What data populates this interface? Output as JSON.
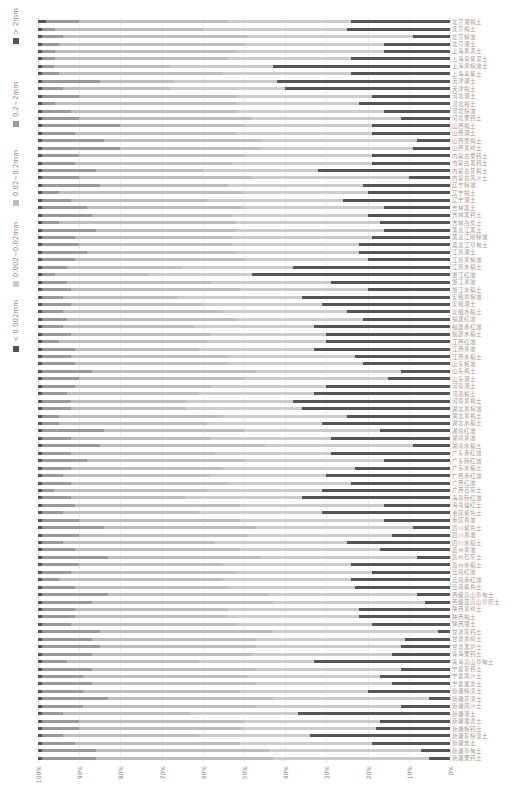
{
  "chart_data": {
    "type": "bar",
    "orientation": "horizontal-stacked-100",
    "title": "",
    "xlabel": "",
    "ylabel": "",
    "xlim": [
      100,
      0
    ],
    "x_ticks": [
      "100%",
      "90%",
      "80%",
      "70%",
      "60%",
      "50%",
      "40%",
      "30%",
      "20%",
      "10%",
      "0%"
    ],
    "grid": true,
    "legend_position": "left",
    "series_names": [
      "< 0.002mm",
      "0.002~0.02mm",
      "0.02~0.2mm",
      "0.2~2mm",
      "> 2mm"
    ],
    "colors": [
      "#555555",
      "#cccccc",
      "#bdbdbd",
      "#999999",
      "#555555"
    ],
    "categories": [
      "北京潮褐土",
      "北京褐土",
      "北京棕壤",
      "北京潮土",
      "上海黄泥土",
      "上海青紫泥土",
      "上海黄棕壤土",
      "上海青紫土",
      "天津潮土",
      "天津褐土",
      "河北潮土",
      "河北褐土",
      "河北棕壤",
      "河北栗钙土",
      "山西褐土",
      "山西潮土",
      "山西栗褐土",
      "山西黄绵土",
      "内蒙古栗钙土",
      "内蒙古黑钙土",
      "内蒙古灰褐土",
      "内蒙古风沙土",
      "辽宁棕壤",
      "辽宁褐土",
      "辽宁潮土",
      "吉林黑土",
      "吉林黑钙土",
      "吉林白浆土",
      "黑龙江黑土",
      "黑龙江暗棕壤",
      "黑龙江草甸土",
      "江苏潮土",
      "江苏黄棕壤",
      "江苏水稻土",
      "浙江红壤",
      "浙江黄壤",
      "浙江水稻土",
      "安徽黄棕壤",
      "安徽潮土",
      "安徽水稻土",
      "福建红壤",
      "福建赤红壤",
      "福建水稻土",
      "江西红壤",
      "江西黄壤",
      "江西水稻土",
      "山东棕壤",
      "山东褐土",
      "山东潮土",
      "河南潮土",
      "河南褐土",
      "河南黄褐土",
      "湖北黄棕壤",
      "湖北黄褐土",
      "湖北水稻土",
      "湖南红壤",
      "湖南黄壤",
      "湖南水稻土",
      "广东赤红壤",
      "广东砖红壤",
      "广东水稻土",
      "广西赤红壤",
      "广西红壤",
      "广西石灰土",
      "海南砖红壤",
      "海南燥红土",
      "重庆紫色土",
      "重庆黄壤",
      "四川紫色土",
      "四川黄壤",
      "四川水稻土",
      "贵州黄壤",
      "贵州石灰土",
      "贵州水稻土",
      "云南红壤",
      "云南赤红壤",
      "云南紫色土",
      "西藏高山草甸土",
      "西藏亚高山草原土",
      "陕西黄绵土",
      "陕西褐土",
      "陕西塿土",
      "甘肃灰钙土",
      "甘肃黄绵土",
      "甘肃黑垆土",
      "青海栗钙土",
      "青海高山草甸土",
      "宁夏灰钙土",
      "宁夏风沙土",
      "宁夏灌淤土",
      "新疆棕漠土",
      "新疆灰漠土",
      "新疆风沙土",
      "新疆潮土",
      "新疆灌淤土",
      "新疆棕钙土",
      "新疆灰棕漠土",
      "新疆盐土",
      "新疆草甸土",
      "新疆栗钙土"
    ],
    "series": [
      {
        "name": "< 0.002mm",
        "values": [
          24,
          25,
          9,
          16,
          16,
          24,
          43,
          24,
          42,
          40,
          19,
          22,
          16,
          12,
          19,
          19,
          8,
          9,
          19,
          19,
          32,
          10,
          21,
          20,
          26,
          16,
          20,
          17,
          16,
          19,
          22,
          22,
          20,
          38,
          48,
          29,
          20,
          36,
          31,
          25,
          21,
          33,
          30,
          30,
          33,
          23,
          21,
          12,
          15,
          30,
          33,
          38,
          36,
          25,
          31,
          17,
          29,
          9,
          29,
          16,
          23,
          30,
          24,
          31,
          36,
          16,
          31,
          16,
          9,
          14,
          25,
          17,
          8,
          24,
          19,
          24,
          23,
          8,
          6,
          22,
          22,
          19,
          3,
          11,
          12,
          14,
          33,
          12,
          17,
          14,
          20,
          5,
          12,
          37,
          17,
          18,
          34,
          19,
          7,
          5
        ]
      },
      {
        "name": "0.002~0.02mm",
        "values": [
          30,
          35,
          40,
          34,
          36,
          30,
          25,
          31,
          25,
          28,
          33,
          30,
          36,
          36,
          31,
          33,
          38,
          37,
          31,
          34,
          28,
          38,
          33,
          30,
          33,
          34,
          33,
          35,
          36,
          34,
          31,
          30,
          30,
          27,
          25,
          29,
          31,
          30,
          29,
          30,
          31,
          29,
          28,
          29,
          28,
          31,
          33,
          35,
          35,
          28,
          28,
          26,
          28,
          30,
          28,
          33,
          29,
          36,
          28,
          34,
          32,
          28,
          30,
          28,
          28,
          35,
          30,
          35,
          38,
          35,
          32,
          34,
          38,
          31,
          33,
          31,
          31,
          36,
          37,
          32,
          32,
          33,
          40,
          36,
          35,
          34,
          28,
          35,
          32,
          33,
          31,
          38,
          35,
          26,
          33,
          32,
          27,
          32,
          37,
          38
        ]
      },
      {
        "name": "0.02~0.2mm",
        "values": [
          36,
          36,
          45,
          45,
          44,
          42,
          28,
          40,
          18,
          26,
          38,
          44,
          40,
          42,
          30,
          39,
          38,
          34,
          40,
          38,
          26,
          42,
          31,
          45,
          33,
          38,
          34,
          43,
          34,
          38,
          37,
          36,
          41,
          28,
          23,
          35,
          41,
          28,
          32,
          39,
          41,
          32,
          34,
          36,
          30,
          38,
          37,
          40,
          40,
          33,
          32,
          28,
          28,
          40,
          36,
          34,
          34,
          40,
          35,
          38,
          37,
          36,
          38,
          37,
          28,
          40,
          33,
          39,
          37,
          41,
          37,
          40,
          37,
          35,
          40,
          40,
          37,
          39,
          44,
          37,
          37,
          40,
          42,
          40,
          38,
          39,
          32,
          40,
          40,
          40,
          38,
          40,
          42,
          31,
          40,
          40,
          33,
          40,
          42,
          43
        ]
      },
      {
        "name": "0.2~2mm",
        "values": [
          8,
          3,
          5,
          4,
          3,
          3,
          3,
          4,
          14,
          5,
          9,
          3,
          7,
          9,
          19,
          8,
          15,
          19,
          9,
          8,
          13,
          9,
          14,
          4,
          7,
          11,
          12,
          4,
          13,
          8,
          9,
          11,
          8,
          6,
          3,
          6,
          7,
          5,
          7,
          5,
          6,
          5,
          7,
          4,
          8,
          7,
          8,
          12,
          9,
          8,
          6,
          7,
          7,
          4,
          4,
          15,
          7,
          14,
          7,
          11,
          7,
          5,
          7,
          3,
          7,
          8,
          5,
          9,
          15,
          9,
          5,
          8,
          16,
          9,
          7,
          4,
          8,
          16,
          12,
          8,
          8,
          7,
          14,
          12,
          14,
          12,
          6,
          12,
          10,
          12,
          10,
          16,
          10,
          5,
          9,
          9,
          5,
          8,
          13,
          13
        ]
      },
      {
        "name": "> 2mm",
        "values": [
          2,
          1,
          1,
          1,
          1,
          1,
          1,
          1,
          1,
          1,
          1,
          1,
          1,
          1,
          1,
          1,
          1,
          1,
          1,
          1,
          1,
          1,
          1,
          1,
          1,
          1,
          1,
          1,
          1,
          1,
          1,
          1,
          1,
          1,
          1,
          1,
          1,
          1,
          1,
          1,
          1,
          1,
          1,
          1,
          1,
          1,
          1,
          1,
          1,
          1,
          1,
          1,
          1,
          1,
          1,
          1,
          1,
          1,
          1,
          1,
          1,
          1,
          1,
          1,
          1,
          1,
          1,
          1,
          1,
          1,
          1,
          1,
          1,
          1,
          1,
          1,
          1,
          1,
          1,
          1,
          1,
          1,
          1,
          1,
          1,
          1,
          1,
          1,
          1,
          1,
          1,
          1,
          1,
          1,
          1,
          1,
          1,
          1,
          1,
          1
        ]
      }
    ]
  },
  "legend": {
    "items": [
      {
        "label": "> 2mm",
        "color": "#555555"
      },
      {
        "label": "0.2~2mm",
        "color": "#999999"
      },
      {
        "label": "0.02~0.2mm",
        "color": "#bdbdbd"
      },
      {
        "label": "0.002~0.02mm",
        "color": "#cccccc"
      },
      {
        "label": "< 0.002mm",
        "color": "#555555"
      }
    ]
  }
}
